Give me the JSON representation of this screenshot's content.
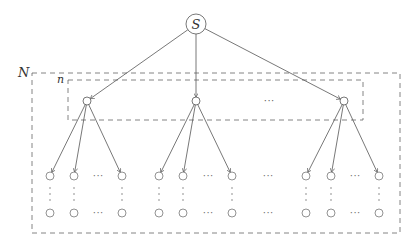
{
  "diagram": {
    "type": "tree",
    "root": {
      "label": "S",
      "x": 196,
      "y": 24
    },
    "outer_box": {
      "label": "N",
      "x": 32,
      "y": 73,
      "w": 368,
      "h": 160
    },
    "inner_box": {
      "label": "n",
      "x": 68,
      "y": 80,
      "w": 295,
      "h": 40
    },
    "level1": [
      {
        "x": 87,
        "y": 101
      },
      {
        "x": 196,
        "y": 101
      },
      {
        "x": 344,
        "y": 101
      }
    ],
    "level1_ellipsis": {
      "text": "···",
      "x": 269,
      "y": 104
    },
    "leaf_groups": [
      {
        "parent": 0,
        "xs": [
          50,
          74,
          122
        ],
        "ellipsis_x": 98
      },
      {
        "parent": 1,
        "xs": [
          159,
          183,
          232
        ],
        "ellipsis_x": 208
      },
      {
        "parent": 2,
        "xs": [
          306,
          331,
          379
        ],
        "ellipsis_x": 355
      }
    ],
    "group_ellipsis": {
      "text": "···",
      "x": 268
    },
    "leaf_top_y": 176,
    "leaf_bottom_y": 213,
    "vdots": "⋮",
    "hdots": "···",
    "line_color": "#555555",
    "dash_color": "#666666"
  }
}
